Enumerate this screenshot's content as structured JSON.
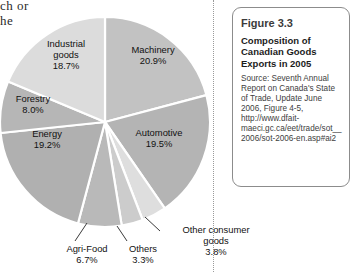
{
  "page_bleed": {
    "line1": "ch or",
    "line2": "he"
  },
  "chart_data": {
    "type": "pie",
    "title": "Composition of Canadian Goods Exports in 2005",
    "unit": "percent",
    "total": 100.0,
    "legend": "none",
    "labels_inside_slices": true,
    "start_angle_deg": 0,
    "direction": "clockwise",
    "categories": [
      "Machinery",
      "Automotive",
      "Other consumer goods",
      "Others",
      "Agri-Food",
      "Energy",
      "Forestry",
      "Industrial goods"
    ],
    "values": [
      20.9,
      19.5,
      3.8,
      3.3,
      6.7,
      19.2,
      8.0,
      18.7
    ],
    "slices": [
      {
        "name": "Machinery",
        "value": 20.9,
        "value_text": "20.9%",
        "color": "#c2c2c2"
      },
      {
        "name": "Automotive",
        "value": 19.5,
        "value_text": "19.5%",
        "color": "#b4b4b4"
      },
      {
        "name": "Other consumer goods",
        "value": 3.8,
        "value_text": "3.8%",
        "color": "#dedede"
      },
      {
        "name": "Others",
        "value": 3.3,
        "value_text": "3.3%",
        "color": "#cccccc"
      },
      {
        "name": "Agri-Food",
        "value": 6.7,
        "value_text": "6.7%",
        "color": "#b9b9b9"
      },
      {
        "name": "Energy",
        "value": 19.2,
        "value_text": "19.2%",
        "color": "#b0b0b0"
      },
      {
        "name": "Forestry",
        "value": 8.0,
        "value_text": "8.0%",
        "color": "#b6b6b6"
      },
      {
        "name": "Industrial goods",
        "value": 18.7,
        "value_text": "18.7%",
        "color": "#dcdcdc"
      }
    ],
    "slice_separator_color": "#ffffff"
  },
  "labels": {
    "machinery": {
      "name": "Machinery",
      "pct": "20.9%"
    },
    "industrial": {
      "name": "Industrial",
      "name2": "goods",
      "pct": "18.7%"
    },
    "forestry": {
      "name": "Forestry",
      "pct": "8.0%"
    },
    "energy": {
      "name": "Energy",
      "pct": "19.2%"
    },
    "automotive": {
      "name": "Automotive",
      "pct": "19.5%"
    },
    "agrifood": {
      "name": "Agri-Food",
      "pct": "6.7%"
    },
    "others": {
      "name": "Others",
      "pct": "3.3%"
    },
    "other_consumer": {
      "name": "Other consumer",
      "name2": "goods",
      "pct": "3.8%"
    }
  },
  "caption": {
    "figure_number": "Figure 3.3",
    "title_line1": "Composition of",
    "title_line2": "Canadian Goods",
    "title_line3": "Exports in 2005",
    "source": "Source: Seventh Annual Report on Canada's State of Trade, Update June 2006, Figure 4-5, http://www.dfait-maeci.gc.ca/eet/trade/sot__2006/sot-2006-en.asp#ai2"
  }
}
